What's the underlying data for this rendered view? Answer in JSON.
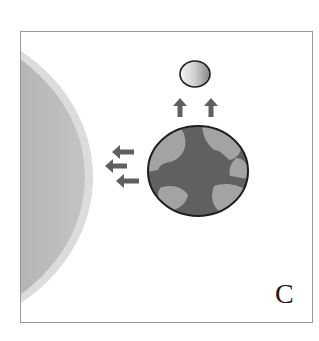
{
  "figure": {
    "panel_label": "C",
    "elements": {
      "sun": {
        "label": "sun-edge",
        "fill": "#a9a9a9",
        "rim": "#d9d9d9"
      },
      "earth": {
        "label": "earth",
        "ocean": "#606060",
        "land": "#a3a3a3",
        "outline": "#1e1e1e"
      },
      "moon": {
        "label": "moon",
        "fill_light": "#f2f2f2",
        "fill_dark": "#8c8c8c",
        "outline": "#1e1e1e"
      },
      "arrow_color": "#5f5f5f",
      "arrows_left_count": 3,
      "arrows_up_count": 2
    },
    "frame_color": "#9a9a9a"
  }
}
